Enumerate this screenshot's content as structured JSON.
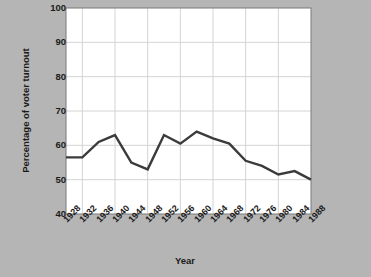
{
  "chart_data": {
    "type": "line",
    "title": "",
    "xlabel": "Year",
    "ylabel": "Percentage of voter turnout",
    "categories": [
      "1928",
      "1932",
      "1936",
      "1940",
      "1944",
      "1948",
      "1952",
      "1956",
      "1960",
      "1964",
      "1968",
      "1972",
      "1976",
      "1980",
      "1984",
      "1988"
    ],
    "x": [
      1928,
      1932,
      1936,
      1940,
      1944,
      1948,
      1952,
      1956,
      1960,
      1964,
      1968,
      1972,
      1976,
      1980,
      1984,
      1988
    ],
    "values": [
      56.5,
      56.5,
      61,
      63,
      55,
      53,
      63,
      60.5,
      64,
      62,
      60.5,
      55.5,
      54,
      51.5,
      52.5,
      50
    ],
    "series": [
      {
        "name": "Voter turnout",
        "values": [
          56.5,
          56.5,
          61,
          63,
          55,
          53,
          63,
          60.5,
          64,
          62,
          60.5,
          55.5,
          54,
          51.5,
          52.5,
          50
        ]
      }
    ],
    "ylim": [
      40,
      100
    ],
    "ytick_labels": [
      "100",
      "90",
      "80",
      "70",
      "60",
      "50",
      "40"
    ],
    "ytick_values": [
      100,
      90,
      80,
      70,
      60,
      50,
      40
    ],
    "xlim": [
      1928,
      1988
    ],
    "grid": true,
    "legend": "none",
    "line_color": "#3b3b3b",
    "plot_background": "#ffffff",
    "page_background": "#b5b5b5",
    "grid_color": "#d4d4d4",
    "text_color": "#1a1a1a"
  }
}
